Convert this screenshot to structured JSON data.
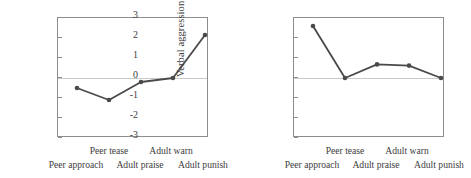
{
  "figure": {
    "panels": [
      {
        "name": "left-panel",
        "ylabel": "Verbal aggression",
        "yticks": [
          "3",
          "2",
          "1",
          "0",
          "-1",
          "-2",
          "-3"
        ]
      },
      {
        "name": "right-panel",
        "ylabel": "Verbal aggression",
        "yticks": [
          "3",
          "2",
          "1",
          "0",
          "-1",
          "-2",
          "-3"
        ]
      }
    ]
  },
  "chart_data": [
    {
      "type": "line",
      "title": "",
      "xlabel": "",
      "ylabel": "Verbal aggression",
      "categories": [
        "Peer approach",
        "Peer tease",
        "Adult praise",
        "Adult warn",
        "Adult punish"
      ],
      "values": [
        -0.5,
        -1.1,
        -0.2,
        0.0,
        2.15
      ],
      "ylim": [
        -3,
        3
      ],
      "yticks": [
        -3,
        -2,
        -1,
        0,
        1,
        2,
        3
      ],
      "grid": false,
      "zero_reference_line": true,
      "legend": "none",
      "marker": "circle",
      "line_color": "#4a4a4a",
      "marker_color": "#4a4a4a"
    },
    {
      "type": "line",
      "title": "",
      "xlabel": "",
      "ylabel": "Verbal aggression",
      "categories": [
        "Peer approach",
        "Peer tease",
        "Adult praise",
        "Adult warn",
        "Adult punish"
      ],
      "values": [
        2.6,
        0.0,
        0.68,
        0.62,
        0.0
      ],
      "ylim": [
        -3,
        3
      ],
      "yticks": [
        -3,
        -2,
        -1,
        0,
        1,
        2,
        3
      ],
      "grid": false,
      "zero_reference_line": true,
      "legend": "none",
      "marker": "circle",
      "line_color": "#4a4a4a",
      "marker_color": "#4a4a4a"
    }
  ]
}
